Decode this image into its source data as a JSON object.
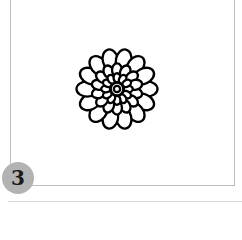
{
  "figure": {
    "badge": {
      "number": "3",
      "color": "#b3b3b3"
    },
    "illustration": {
      "subject": "flower-outline",
      "stroke_color": "#000000"
    },
    "frame_color": "#bdbdbd"
  }
}
